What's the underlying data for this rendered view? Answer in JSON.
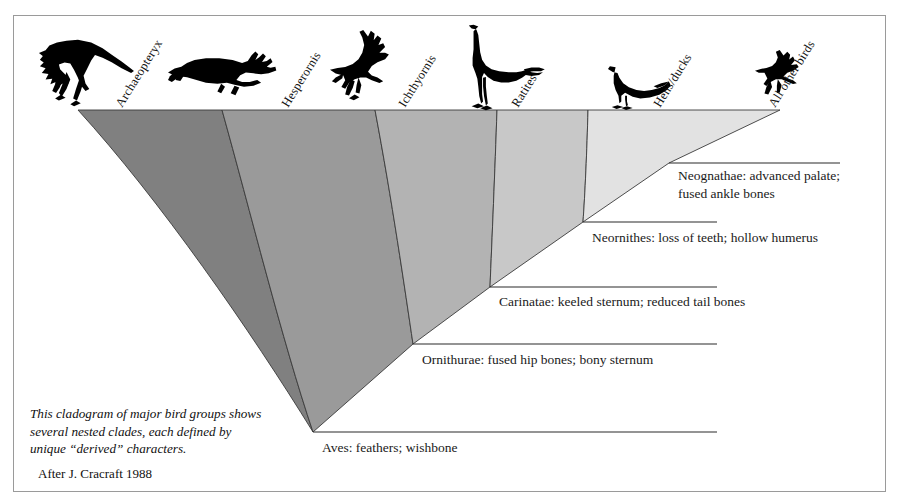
{
  "figure": {
    "title": "Cladogram of major bird groups",
    "border_color": "#9a9a9a",
    "background": "#ffffff"
  },
  "taxa": [
    {
      "id": "archaeopteryx",
      "label": "Archaeopteryx",
      "icon": "archaeopteryx-silhouette",
      "tip_x": 78,
      "label_x": 120,
      "label_y": 108,
      "rotation": -58
    },
    {
      "id": "hesperornis",
      "label": "Hesperornis",
      "icon": "hesperornis-silhouette",
      "tip_x": 222,
      "label_x": 286,
      "label_y": 108,
      "rotation": -58
    },
    {
      "id": "ichthyornis",
      "label": "Ichthyornis",
      "icon": "ichthyornis-silhouette",
      "tip_x": 375,
      "label_x": 405,
      "label_y": 108,
      "rotation": -58
    },
    {
      "id": "ratites",
      "label": "Ratites",
      "icon": "ratite-ostrich-silhouette",
      "tip_x": 497,
      "label_x": 518,
      "label_y": 108,
      "rotation": -58
    },
    {
      "id": "hens-ducks",
      "label": "Hens/ducks",
      "icon": "duck-silhouette",
      "tip_x": 588,
      "label_x": 660,
      "label_y": 108,
      "rotation": -58
    },
    {
      "id": "all-other-birds",
      "label": "All other birds",
      "icon": "flying-bird-silhouette",
      "tip_x": 780,
      "label_x": 775,
      "label_y": 108,
      "rotation": -58
    }
  ],
  "clades": [
    {
      "id": "aves",
      "name": "Aves",
      "characters": "feathers; wishbone",
      "label": "Aves: feathers; wishbone",
      "node_x": 313,
      "node_y": 432,
      "line_end_x": 717,
      "label_x": 322,
      "label_y": 452,
      "fill": "#808080"
    },
    {
      "id": "ornithurae",
      "name": "Ornithurae",
      "characters": "fused hip bones; bony sternum",
      "label": "Ornithurae: fused hip bones; bony sternum",
      "node_x": 413,
      "node_y": 344,
      "line_end_x": 717,
      "label_x": 422,
      "label_y": 364,
      "fill": "#9a9a9a"
    },
    {
      "id": "carinatae",
      "name": "Carinatae",
      "characters": "keeled sternum; reduced tail bones",
      "label": "Carinatae: keeled sternum; reduced tail bones",
      "node_x": 490,
      "node_y": 287,
      "line_end_x": 717,
      "label_x": 499,
      "label_y": 306,
      "fill": "#b3b3b3"
    },
    {
      "id": "neornithes",
      "name": "Neornithes",
      "characters": "loss of teeth; hollow humerus",
      "label": "Neornithes: loss of teeth; hollow humerus",
      "node_x": 583,
      "node_y": 222,
      "line_end_x": 717,
      "label_x": 592,
      "label_y": 242,
      "fill": "#c8c8c8"
    },
    {
      "id": "neognathae",
      "name": "Neognathae",
      "characters": "advanced palate; fused ankle bones",
      "label_line1": "Neognathae: advanced palate;",
      "label_line2": "fused ankle bones",
      "node_x": 669,
      "node_y": 163,
      "line_end_x": 840,
      "label_x": 678,
      "label_y": 180,
      "fill": "#e2e2e2"
    }
  ],
  "caption": {
    "body": "This cladogram of major bird groups shows several nested clades, each defined by unique “derived” characters.",
    "source": "After J. Cracraft 1988"
  },
  "wedge": {
    "top_y": 110,
    "apex_x": 313,
    "apex_y": 432,
    "left_x": 78,
    "right_x": 780,
    "band_boundaries": [
      222,
      375,
      497,
      588
    ],
    "stroke": "#3a3a3a"
  }
}
